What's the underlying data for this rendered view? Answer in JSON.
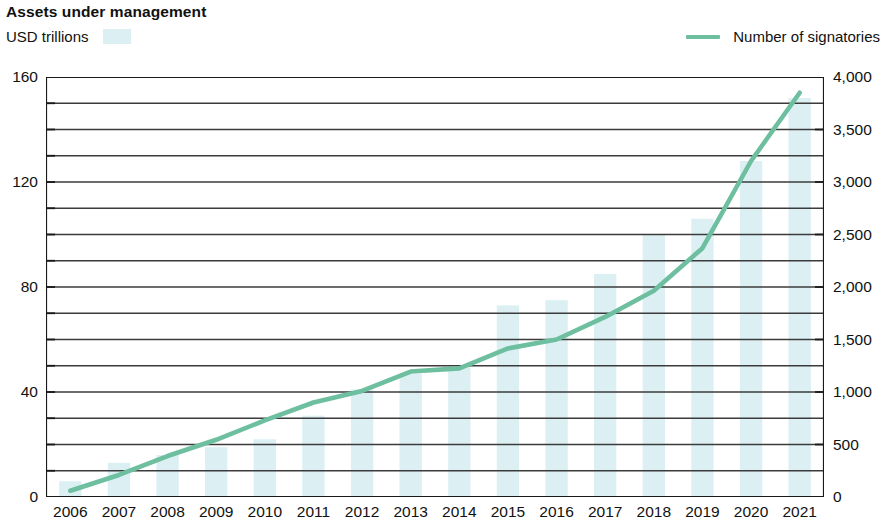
{
  "header": {
    "title": "Assets under management",
    "bar_legend_label": "USD trillions",
    "line_legend_label": "Number of signatories",
    "bar_color": "#dcf0f4",
    "line_color": "#6dbfa0"
  },
  "chart_data": {
    "type": "bar",
    "title": "Assets under management",
    "subtitle": "USD trillions",
    "xlabel": "",
    "ylabel": "USD trillions",
    "ylabel_right": "Number of signatories",
    "grid": true,
    "legend_position": "top",
    "categories": [
      "2006",
      "2007",
      "2008",
      "2009",
      "2010",
      "2011",
      "2012",
      "2013",
      "2014",
      "2015",
      "2016",
      "2017",
      "2018",
      "2019",
      "2020",
      "2021"
    ],
    "ylim": [
      0,
      160
    ],
    "yticks": [
      0,
      40,
      80,
      120,
      160
    ],
    "ytick_labels": [
      "0",
      "40",
      "80",
      "120",
      "160"
    ],
    "yminor_step": 10,
    "ylim_right": [
      0,
      4000
    ],
    "yticks_right": [
      0,
      500,
      1000,
      1500,
      2000,
      2500,
      3000,
      3500,
      4000
    ],
    "ytick_labels_right": [
      "0",
      "500",
      "1,000",
      "1,500",
      "2,000",
      "2,500",
      "3,000",
      "3,500",
      "4,000"
    ],
    "series": [
      {
        "name": "USD trillions",
        "type": "bar",
        "axis": "left",
        "color": "#dcf0f4",
        "values": [
          6,
          13,
          16,
          19,
          22,
          31,
          41,
          47,
          50,
          73,
          75,
          85,
          100,
          106,
          128,
          152
        ]
      },
      {
        "name": "Number of signatories",
        "type": "line",
        "axis": "right",
        "color": "#6dbfa0",
        "values": [
          60,
          210,
          390,
          545,
          730,
          900,
          1010,
          1195,
          1225,
          1415,
          1500,
          1715,
          1965,
          2370,
          3200,
          3850
        ]
      }
    ]
  }
}
